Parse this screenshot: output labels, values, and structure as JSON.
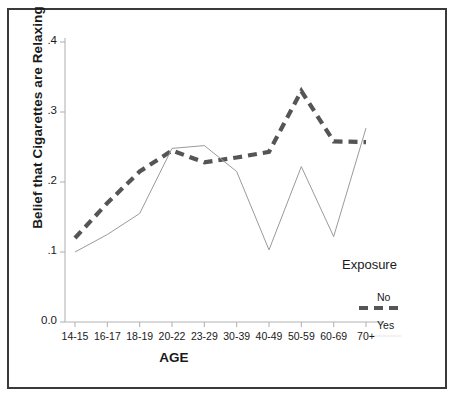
{
  "figure": {
    "ylabel": "Belief that Cigarettes are Relaxing",
    "xlabel": "AGE",
    "legend_title": "Exposure",
    "legend_no": "No",
    "legend_yes": "Yes",
    "caption_ghost": ""
  },
  "colors": {
    "frame": "#3a3a3a",
    "axis": "#b4b4b4",
    "series_no": "#555555",
    "series_yes": "#9a9a9a",
    "background": "#ffffff",
    "text": "#1a1a1a"
  },
  "chart_data": {
    "type": "line",
    "title": "",
    "xlabel": "AGE",
    "ylabel": "Belief that Cigarettes are Relaxing",
    "categories": [
      "14-15",
      "16-17",
      "18-19",
      "20-22",
      "23-29",
      "30-39",
      "40-49",
      "50-59",
      "60-69",
      "70+"
    ],
    "yticks": [
      "0.0",
      ".1",
      ".2",
      ".3",
      ".4"
    ],
    "ytick_values": [
      0.0,
      0.1,
      0.2,
      0.3,
      0.4
    ],
    "ylim": [
      0.0,
      0.4
    ],
    "grid": false,
    "legend_position": "right",
    "legend_title": "Exposure",
    "series": [
      {
        "name": "No",
        "style": "dashed",
        "color": "#555555",
        "values": [
          0.12,
          0.17,
          0.215,
          0.245,
          0.228,
          0.235,
          0.243,
          0.33,
          0.258,
          0.257
        ]
      },
      {
        "name": "Yes",
        "style": "solid",
        "color": "#9a9a9a",
        "values": [
          0.1,
          0.125,
          0.155,
          0.248,
          0.252,
          0.215,
          0.103,
          0.222,
          0.122,
          0.277
        ]
      }
    ]
  }
}
